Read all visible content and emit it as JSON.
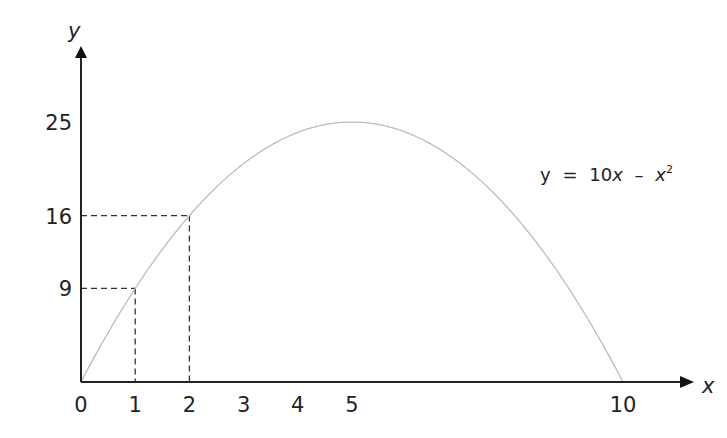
{
  "chart_data": {
    "type": "line",
    "title": "",
    "xlabel": "x",
    "ylabel": "y",
    "equation": {
      "lhs": "y",
      "eq": "=",
      "coef": "10",
      "var": "x",
      "minus": "–",
      "var2": "x",
      "exp": "2"
    },
    "function": "10x - x^2",
    "xlim": [
      0,
      10
    ],
    "ylim": [
      0,
      25
    ],
    "x_ticks": [
      "0",
      "1",
      "2",
      "3",
      "4",
      "5",
      "10"
    ],
    "x_tick_values": [
      0,
      1,
      2,
      3,
      4,
      5,
      10
    ],
    "y_ticks": [
      "9",
      "16",
      "25"
    ],
    "y_tick_values": [
      9,
      16,
      25
    ],
    "series": [
      {
        "name": "y = 10x - x^2",
        "x": [
          0,
          1,
          2,
          3,
          4,
          5,
          6,
          7,
          8,
          9,
          10
        ],
        "y": [
          0,
          9,
          16,
          21,
          24,
          25,
          24,
          21,
          16,
          9,
          0
        ]
      }
    ],
    "guides": [
      {
        "x": 1,
        "y": 9
      },
      {
        "x": 2,
        "y": 16
      }
    ],
    "grid": false,
    "legend": "none"
  }
}
